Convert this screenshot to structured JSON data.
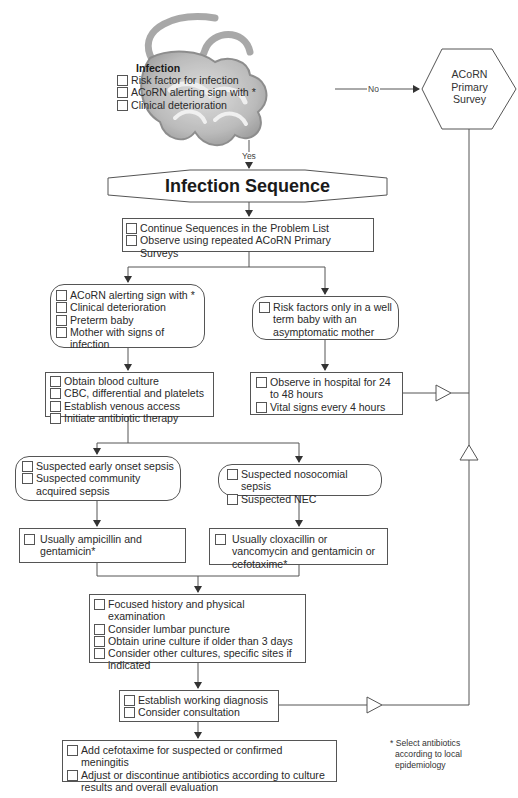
{
  "diagram": {
    "entry": {
      "title": "Infection",
      "items": [
        "Risk factor for infection",
        "ACoRN alerting sign with *",
        "Clinical deterioration"
      ]
    },
    "edge_no_label": "No",
    "edge_yes_label": "Yes",
    "primary_survey": {
      "lines": [
        "ACoRN",
        "Primary",
        "Survey"
      ]
    },
    "sequence_title": "Infection Sequence",
    "continue_box": {
      "items": [
        "Continue Sequences in the Problem List",
        "Observe using repeated ACoRN Primary Surveys"
      ]
    },
    "left_branch": {
      "criteria": [
        "ACoRN alerting sign with *",
        "Clinical deterioration",
        "Preterm baby",
        "Mother with signs of infection"
      ],
      "actions": [
        "Obtain blood culture",
        "CBC, differential and platelets",
        "Establish venous access",
        "Initiate antibiotic therapy"
      ]
    },
    "right_branch": {
      "criteria": [
        "Risk factors only in a well term baby with an asymptomatic mother"
      ],
      "actions": [
        "Observe in hospital for 24 to 48 hours",
        "Vital signs every 4 hours"
      ]
    },
    "sepsis_left": {
      "criteria": [
        "Suspected early onset sepsis",
        "Suspected community acquired sepsis"
      ],
      "treatment": [
        "Usually ampicillin and gentamicin*"
      ]
    },
    "sepsis_right": {
      "criteria": [
        "Suspected nosocomial sepsis",
        "Suspected NEC"
      ],
      "treatment": [
        "Usually cloxacillin or vancomycin and gentamicin or cefotaxime*"
      ]
    },
    "workup": {
      "items": [
        "Focused history and physical examination",
        "Consider lumbar puncture",
        "Obtain urine culture if older than 3 days",
        "Consider other cultures, specific sites if indicated"
      ]
    },
    "diagnosis": {
      "items": [
        "Establish working diagnosis",
        "Consider consultation"
      ]
    },
    "final": {
      "items": [
        "Add cefotaxime for suspected or confirmed meningitis",
        "Adjust or discontinue antibiotics according to culture results and overall evaluation"
      ]
    },
    "footnote": {
      "line1": "* Select antibiotics",
      "line2": "according to local",
      "line3": "epidemiology"
    }
  },
  "colors": {
    "line": "#555555",
    "blob": "#a8a8a8",
    "text": "#2a2a2a"
  }
}
